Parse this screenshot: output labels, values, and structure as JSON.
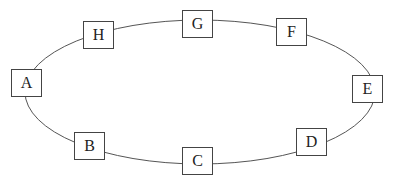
{
  "diagram": {
    "type": "ring",
    "ellipse": {
      "cx": 200,
      "cy": 92,
      "rx": 175,
      "ry": 72,
      "stroke": "#555555"
    },
    "nodes": [
      {
        "id": "A",
        "label": "A",
        "x": 11,
        "y": 69
      },
      {
        "id": "H",
        "label": "H",
        "x": 83,
        "y": 21
      },
      {
        "id": "G",
        "label": "G",
        "x": 182,
        "y": 10
      },
      {
        "id": "F",
        "label": "F",
        "x": 276,
        "y": 18
      },
      {
        "id": "E",
        "label": "E",
        "x": 352,
        "y": 75
      },
      {
        "id": "D",
        "label": "D",
        "x": 296,
        "y": 128
      },
      {
        "id": "C",
        "label": "C",
        "x": 182,
        "y": 147
      },
      {
        "id": "B",
        "label": "B",
        "x": 74,
        "y": 132
      }
    ],
    "edges": [
      [
        "A",
        "H"
      ],
      [
        "H",
        "G"
      ],
      [
        "G",
        "F"
      ],
      [
        "F",
        "E"
      ],
      [
        "E",
        "D"
      ],
      [
        "D",
        "C"
      ],
      [
        "C",
        "B"
      ],
      [
        "B",
        "A"
      ]
    ]
  }
}
